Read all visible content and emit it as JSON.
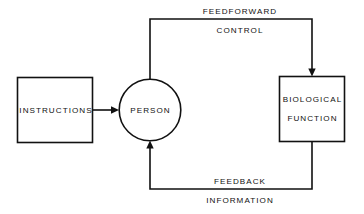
{
  "diagram": {
    "background_color": "#ffffff",
    "line_color": "#111111",
    "nodes": [
      {
        "id": "instructions",
        "shape": "rectangle",
        "label": "INSTRUCTIONS"
      },
      {
        "id": "person",
        "shape": "circle",
        "label": "PERSON"
      },
      {
        "id": "biological-function",
        "shape": "rectangle",
        "label_line1": "BIOLOGICAL",
        "label_line2": "FUNCTION"
      }
    ],
    "edges": [
      {
        "id": "instructions-to-person",
        "label": "",
        "from": "instructions",
        "to": "person",
        "arrow": "single"
      },
      {
        "id": "feedforward",
        "label_line1": "FEEDFORWARD",
        "label_line2": "CONTROL",
        "from": "person",
        "to": "biological-function",
        "arrow": "single"
      },
      {
        "id": "feedback",
        "label_line1": "FEEDBACK",
        "label_line2": "INFORMATION",
        "from": "biological-function",
        "to": "person",
        "arrow": "single"
      }
    ]
  }
}
